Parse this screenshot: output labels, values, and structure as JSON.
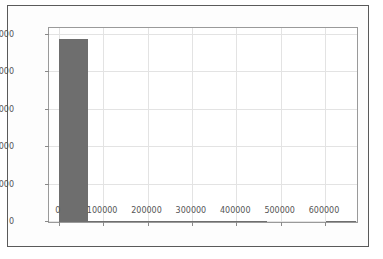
{
  "chart_data": {
    "type": "bar",
    "title": "",
    "xlabel": "",
    "ylabel": "",
    "xlim": [
      -22000,
      672000
    ],
    "ylim": [
      0,
      5180
    ],
    "grid": true,
    "legend": null,
    "bar_color": "#6e6e6e",
    "background_color": "#ffffff",
    "gridline_color": "#e3e3e3",
    "axis_border_color": "#9a9a9a",
    "figure_border_color": "#5a5a5a",
    "xticks": [
      0,
      100000,
      200000,
      300000,
      400000,
      500000,
      600000
    ],
    "xticklabels": [
      "0",
      "100000",
      "200000",
      "300000",
      "400000",
      "500000",
      "600000"
    ],
    "yticks": [
      0,
      1000,
      2000,
      3000,
      4000,
      5000
    ],
    "yticklabels": [
      "0",
      "1000",
      "2000",
      "3000",
      "4000",
      "5000"
    ],
    "bin_edges": [
      0,
      67000,
      134000,
      201000,
      268000,
      335000,
      402000,
      469000,
      536000,
      603000,
      670000
    ],
    "bin_centers": [
      33500,
      100500,
      167500,
      234500,
      301500,
      368500,
      435500,
      502500,
      569500,
      636500
    ],
    "values": [
      4880,
      22,
      6,
      3,
      2,
      1,
      1,
      0,
      0,
      1
    ]
  }
}
